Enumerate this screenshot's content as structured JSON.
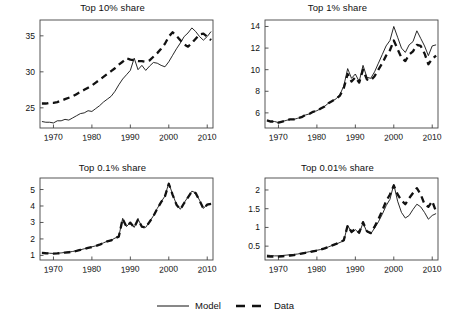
{
  "chart_data": [
    {
      "type": "line",
      "title": "Top 10% share",
      "xlabel": "",
      "ylabel": "",
      "xlim": [
        1966.5,
        2011.5
      ],
      "ylim": [
        22.2,
        37.2
      ],
      "xticks": [
        1970,
        1980,
        1990,
        2000,
        2010
      ],
      "yticks": [
        25,
        30,
        35
      ],
      "grid": false,
      "legend_position": "figure-bottom-center",
      "x": [
        1967,
        1968,
        1969,
        1970,
        1971,
        1972,
        1973,
        1974,
        1975,
        1976,
        1977,
        1978,
        1979,
        1980,
        1981,
        1982,
        1983,
        1984,
        1985,
        1986,
        1987,
        1988,
        1989,
        1990,
        1991,
        1992,
        1993,
        1994,
        1995,
        1996,
        1997,
        1998,
        1999,
        2000,
        2001,
        2002,
        2003,
        2004,
        2005,
        2006,
        2007,
        2008,
        2009,
        2010,
        2011
      ],
      "series": [
        {
          "name": "Model",
          "style": "solid",
          "values": [
            23.1,
            23.0,
            23.0,
            22.9,
            23.2,
            23.2,
            23.4,
            23.3,
            23.6,
            23.9,
            24.2,
            24.3,
            24.6,
            24.5,
            24.9,
            25.3,
            25.8,
            26.2,
            26.6,
            27.3,
            28.2,
            29.0,
            29.6,
            30.2,
            31.9,
            30.3,
            30.9,
            30.2,
            30.8,
            31.3,
            31.2,
            30.9,
            30.7,
            31.4,
            32.3,
            33.2,
            34.0,
            34.9,
            35.4,
            36.1,
            35.6,
            34.9,
            34.4,
            34.9,
            35.6
          ]
        },
        {
          "name": "Data",
          "style": "dashed",
          "values": [
            25.6,
            25.6,
            25.7,
            25.7,
            25.8,
            26.0,
            26.2,
            26.4,
            26.6,
            26.9,
            27.2,
            27.5,
            27.8,
            28.1,
            28.5,
            28.9,
            29.3,
            29.7,
            30.1,
            30.5,
            31.0,
            31.4,
            31.9,
            31.7,
            31.6,
            31.5,
            31.5,
            31.4,
            31.6,
            32.1,
            32.6,
            33.2,
            33.9,
            34.9,
            35.5,
            35.0,
            34.4,
            33.8,
            33.5,
            34.0,
            34.6,
            35.2,
            35.3,
            34.9,
            34.4,
            35.2
          ]
        }
      ]
    },
    {
      "type": "line",
      "title": "Top 1% share",
      "xlabel": "",
      "ylabel": "",
      "xlim": [
        1966.5,
        2011.5
      ],
      "ylim": [
        4.6,
        14.6
      ],
      "xticks": [
        1970,
        1980,
        1990,
        2000,
        2010
      ],
      "yticks": [
        6,
        8,
        10,
        12,
        14
      ],
      "grid": false,
      "legend_position": "figure-bottom-center",
      "x": [
        1967,
        1968,
        1969,
        1970,
        1971,
        1972,
        1973,
        1974,
        1975,
        1976,
        1977,
        1978,
        1979,
        1980,
        1981,
        1982,
        1983,
        1984,
        1985,
        1986,
        1987,
        1988,
        1989,
        1990,
        1991,
        1992,
        1993,
        1994,
        1995,
        1996,
        1997,
        1998,
        1999,
        2000,
        2001,
        2002,
        2003,
        2004,
        2005,
        2006,
        2007,
        2008,
        2009,
        2010,
        2011
      ],
      "series": [
        {
          "name": "Model",
          "style": "solid",
          "values": [
            5.3,
            5.2,
            5.2,
            5.1,
            5.2,
            5.3,
            5.4,
            5.4,
            5.5,
            5.6,
            5.8,
            5.9,
            6.1,
            6.2,
            6.4,
            6.6,
            6.9,
            7.1,
            7.3,
            7.7,
            8.5,
            10.1,
            9.2,
            9.6,
            8.9,
            10.4,
            9.3,
            9.2,
            9.8,
            10.6,
            11.4,
            12.2,
            12.7,
            14.0,
            13.0,
            12.0,
            11.6,
            12.3,
            12.6,
            13.6,
            12.9,
            12.2,
            11.3,
            12.2,
            12.3
          ]
        },
        {
          "name": "Data",
          "style": "dashed",
          "values": [
            5.3,
            5.2,
            5.2,
            5.1,
            5.2,
            5.3,
            5.4,
            5.4,
            5.5,
            5.6,
            5.8,
            5.9,
            6.1,
            6.2,
            6.4,
            6.6,
            6.9,
            7.1,
            7.3,
            7.6,
            8.3,
            9.6,
            8.9,
            9.3,
            8.8,
            10.0,
            9.1,
            9.0,
            9.4,
            10.0,
            10.6,
            11.3,
            11.8,
            12.7,
            11.9,
            11.1,
            10.8,
            11.4,
            11.7,
            12.3,
            12.2,
            11.5,
            10.5,
            11.0,
            11.3
          ]
        }
      ]
    },
    {
      "type": "line",
      "title": "Top 0.1% share",
      "xlabel": "",
      "ylabel": "",
      "xlim": [
        1966.5,
        2011.5
      ],
      "ylim": [
        0.72,
        5.7
      ],
      "xticks": [
        1970,
        1980,
        1990,
        2000,
        2010
      ],
      "yticks": [
        1,
        2,
        3,
        4,
        5
      ],
      "grid": false,
      "legend_position": "figure-bottom-center",
      "x": [
        1967,
        1968,
        1969,
        1970,
        1971,
        1972,
        1973,
        1974,
        1975,
        1976,
        1977,
        1978,
        1979,
        1980,
        1981,
        1982,
        1983,
        1984,
        1985,
        1986,
        1987,
        1988,
        1989,
        1990,
        1991,
        1992,
        1993,
        1994,
        1995,
        1996,
        1997,
        1998,
        1999,
        2000,
        2001,
        2002,
        2003,
        2004,
        2005,
        2006,
        2007,
        2008,
        2009,
        2010,
        2011
      ],
      "series": [
        {
          "name": "Model",
          "style": "solid",
          "values": [
            1.18,
            1.15,
            1.13,
            1.12,
            1.13,
            1.15,
            1.18,
            1.2,
            1.24,
            1.28,
            1.34,
            1.4,
            1.46,
            1.52,
            1.58,
            1.66,
            1.76,
            1.86,
            1.92,
            2.05,
            2.15,
            3.25,
            2.75,
            3.0,
            2.7,
            3.2,
            2.75,
            2.7,
            3.05,
            3.4,
            3.85,
            4.25,
            4.6,
            5.4,
            4.7,
            4.1,
            3.8,
            4.2,
            4.55,
            4.9,
            4.8,
            4.35,
            3.85,
            4.1,
            4.15
          ]
        },
        {
          "name": "Data",
          "style": "dashed",
          "values": [
            1.15,
            1.13,
            1.12,
            1.11,
            1.12,
            1.14,
            1.17,
            1.19,
            1.23,
            1.27,
            1.33,
            1.39,
            1.45,
            1.51,
            1.57,
            1.65,
            1.75,
            1.85,
            1.91,
            2.04,
            2.14,
            3.22,
            2.74,
            2.99,
            2.69,
            3.18,
            2.74,
            2.69,
            3.04,
            3.38,
            3.83,
            4.23,
            4.58,
            5.35,
            4.68,
            4.08,
            3.79,
            4.18,
            4.53,
            4.88,
            4.78,
            4.33,
            3.84,
            4.08,
            4.13
          ]
        }
      ]
    },
    {
      "type": "line",
      "title": "Top 0.01% share",
      "xlabel": "",
      "ylabel": "",
      "xlim": [
        1966.5,
        2011.5
      ],
      "ylim": [
        0.13,
        2.32
      ],
      "xticks": [
        1970,
        1980,
        1990,
        2000,
        2010
      ],
      "yticks": [
        0.5,
        1,
        1.5,
        2
      ],
      "grid": false,
      "legend_position": "figure-bottom-center",
      "x": [
        1967,
        1968,
        1969,
        1970,
        1971,
        1972,
        1973,
        1974,
        1975,
        1976,
        1977,
        1978,
        1979,
        1980,
        1981,
        1982,
        1983,
        1984,
        1985,
        1986,
        1987,
        1988,
        1989,
        1990,
        1991,
        1992,
        1993,
        1994,
        1995,
        1996,
        1997,
        1998,
        1999,
        2000,
        2001,
        2002,
        2003,
        2004,
        2005,
        2006,
        2007,
        2008,
        2009,
        2010,
        2011
      ],
      "series": [
        {
          "name": "Model",
          "style": "solid",
          "values": [
            0.26,
            0.25,
            0.24,
            0.24,
            0.25,
            0.26,
            0.27,
            0.28,
            0.29,
            0.31,
            0.33,
            0.35,
            0.37,
            0.39,
            0.41,
            0.44,
            0.48,
            0.52,
            0.55,
            0.6,
            0.64,
            1.06,
            0.86,
            0.94,
            0.84,
            1.12,
            0.88,
            0.83,
            0.98,
            1.15,
            1.35,
            1.58,
            1.75,
            2.15,
            1.7,
            1.4,
            1.25,
            1.32,
            1.48,
            1.62,
            1.55,
            1.4,
            1.22,
            1.32,
            1.37
          ]
        },
        {
          "name": "Data",
          "style": "dashed",
          "values": [
            0.23,
            0.22,
            0.22,
            0.22,
            0.23,
            0.24,
            0.25,
            0.26,
            0.28,
            0.3,
            0.32,
            0.34,
            0.36,
            0.38,
            0.41,
            0.44,
            0.48,
            0.52,
            0.56,
            0.61,
            0.66,
            1.05,
            0.88,
            0.96,
            0.86,
            1.14,
            0.9,
            0.85,
            1.02,
            1.22,
            1.45,
            1.7,
            1.88,
            2.12,
            1.88,
            1.72,
            1.62,
            1.78,
            1.92,
            2.05,
            1.88,
            1.62,
            1.55,
            1.7,
            1.42
          ]
        }
      ]
    }
  ],
  "legend": {
    "entries": [
      {
        "label": "Model",
        "style": "solid"
      },
      {
        "label": "Data",
        "style": "dashed"
      }
    ]
  }
}
